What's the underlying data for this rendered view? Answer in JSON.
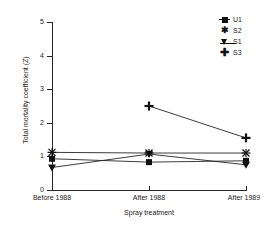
{
  "chart_data": {
    "type": "line",
    "title": "",
    "xlabel": "Spray treatment",
    "ylabel": "Total mortality coefficient (Z)",
    "categories": [
      "Before 1988",
      "After 1988",
      "After 1989"
    ],
    "ylim": [
      0,
      5
    ],
    "yticks": [
      "0",
      "1",
      "2",
      "3",
      "4",
      "5"
    ],
    "grid": false,
    "legend_position": "top-right",
    "series": [
      {
        "name": "U1",
        "marker": "filled-square",
        "values": [
          0.93,
          0.83,
          0.87
        ]
      },
      {
        "name": "S2",
        "marker": "x-cross",
        "values": [
          1.12,
          1.1,
          1.1
        ]
      },
      {
        "name": "S1",
        "marker": "filled-down-triangle",
        "values": [
          0.67,
          1.07,
          0.75
        ]
      },
      {
        "name": "S3",
        "marker": "plus",
        "values": [
          null,
          2.5,
          1.55
        ]
      }
    ],
    "colors": {
      "line": "#262626",
      "marker": "#111111",
      "axis": "#262626"
    }
  },
  "legend": {
    "items": [
      {
        "label": "U1",
        "icon": "filled-square-marker-icon"
      },
      {
        "label": "S2",
        "icon": "x-cross-marker-icon"
      },
      {
        "label": "S1",
        "icon": "filled-down-triangle-marker-icon"
      },
      {
        "label": "S3",
        "icon": "plus-marker-icon"
      }
    ]
  },
  "axes": {
    "y_title": "Total mortality coefficient (Z)",
    "x_title": "Spray treatment",
    "y_tick_labels": [
      "5",
      "4",
      "3",
      "2",
      "1",
      "0"
    ],
    "x_tick_labels": [
      "Before 1988",
      "After 1988",
      "After 1989"
    ]
  }
}
